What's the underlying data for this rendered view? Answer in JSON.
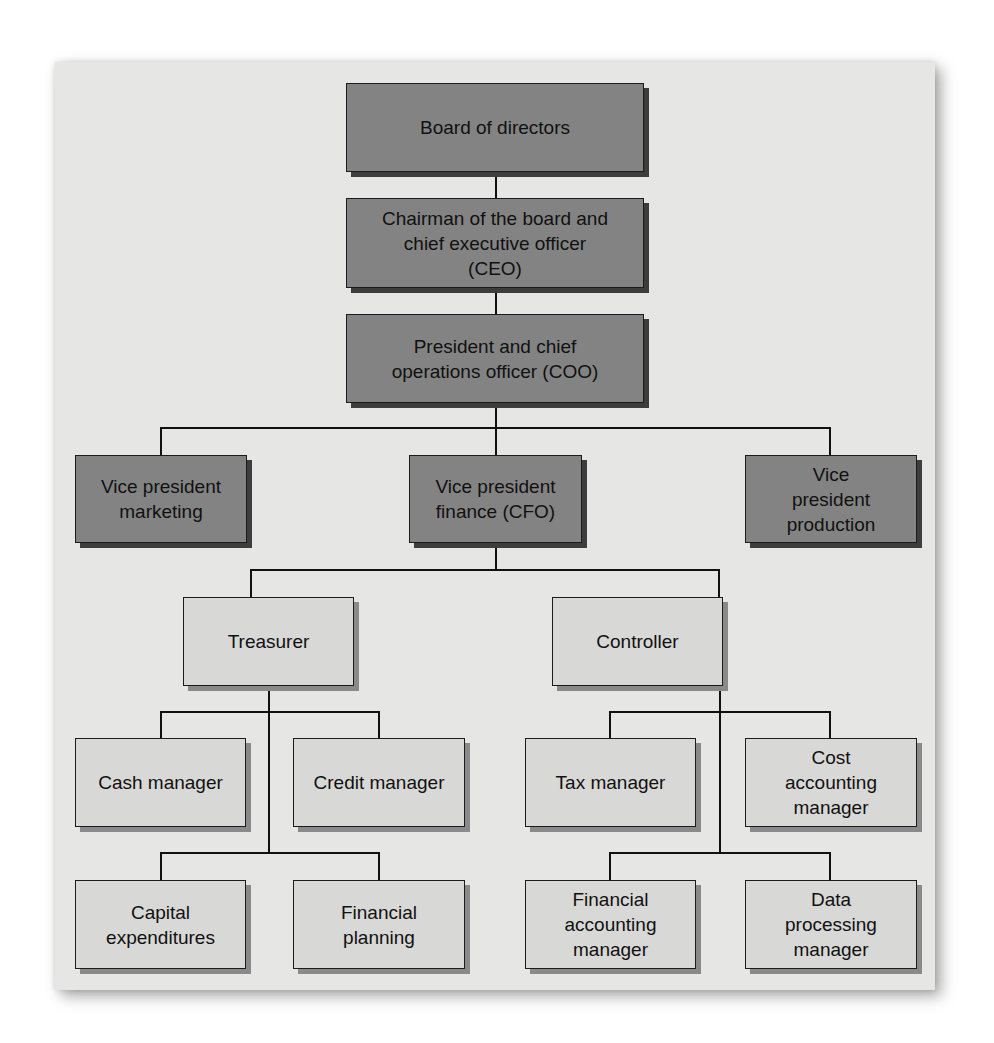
{
  "chart": {
    "type": "org-chart",
    "colors": {
      "executive_fill": "#838383",
      "staff_fill": "#d8d8d6",
      "panel_background": "#e6e6e4",
      "border": "#1c1c1c"
    },
    "nodes": {
      "board": {
        "label": "Board of directors"
      },
      "ceo": {
        "label": "Chairman of the board and\nchief executive officer\n(CEO)"
      },
      "coo": {
        "label": "President and chief\noperations officer (COO)"
      },
      "vp_marketing": {
        "label": "Vice president\nmarketing"
      },
      "vp_finance": {
        "label": "Vice president\nfinance (CFO)"
      },
      "vp_production": {
        "label": "Vice\npresident\nproduction"
      },
      "treasurer": {
        "label": "Treasurer"
      },
      "controller": {
        "label": "Controller"
      },
      "cash_manager": {
        "label": "Cash manager"
      },
      "credit_manager": {
        "label": "Credit manager"
      },
      "capital_expenditures": {
        "label": "Capital\nexpenditures"
      },
      "financial_planning": {
        "label": "Financial\nplanning"
      },
      "tax_manager": {
        "label": "Tax manager"
      },
      "cost_accounting_manager": {
        "label": "Cost\naccounting\nmanager"
      },
      "financial_accounting_manager": {
        "label": "Financial\naccounting\nmanager"
      },
      "data_processing_manager": {
        "label": "Data\nprocessing\nmanager"
      }
    },
    "edges": [
      [
        "board",
        "ceo"
      ],
      [
        "ceo",
        "coo"
      ],
      [
        "coo",
        "vp_marketing"
      ],
      [
        "coo",
        "vp_finance"
      ],
      [
        "coo",
        "vp_production"
      ],
      [
        "vp_finance",
        "treasurer"
      ],
      [
        "vp_finance",
        "controller"
      ],
      [
        "treasurer",
        "cash_manager"
      ],
      [
        "treasurer",
        "credit_manager"
      ],
      [
        "treasurer",
        "capital_expenditures"
      ],
      [
        "treasurer",
        "financial_planning"
      ],
      [
        "controller",
        "tax_manager"
      ],
      [
        "controller",
        "cost_accounting_manager"
      ],
      [
        "controller",
        "financial_accounting_manager"
      ],
      [
        "controller",
        "data_processing_manager"
      ]
    ]
  }
}
